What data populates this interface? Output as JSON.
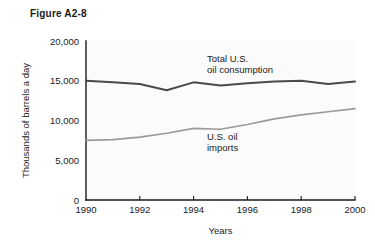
{
  "figure": {
    "title": "Figure A2-8"
  },
  "chart_data": {
    "type": "line",
    "title": "Figure A2-8",
    "xlabel": "Years",
    "ylabel": "Thousands of barrels a day",
    "x": [
      1990,
      1991,
      1992,
      1993,
      1994,
      1995,
      1996,
      1997,
      1998,
      1999,
      2000
    ],
    "xlim": [
      1990,
      2000
    ],
    "ylim": [
      0,
      20000
    ],
    "xticks": [
      1990,
      1992,
      1994,
      1996,
      1998,
      2000
    ],
    "xtick_labels": [
      "1990",
      "1992",
      "1994",
      "1996",
      "1998",
      "2000"
    ],
    "yticks": [
      0,
      5000,
      10000,
      15000,
      20000
    ],
    "ytick_labels": [
      "0",
      "5,000",
      "10,000",
      "15,000",
      "20,000"
    ],
    "grid": false,
    "legend_position": "inline-annotation",
    "series": [
      {
        "name": "Total U.S. oil consumption",
        "label_lines": [
          "Total U.S.",
          "oil consumption"
        ],
        "color": "#4a4a4a",
        "values": [
          15000,
          14800,
          14600,
          13800,
          14800,
          14400,
          14700,
          14900,
          15000,
          14600,
          14900
        ]
      },
      {
        "name": "U.S. oil imports",
        "label_lines": [
          "U.S. oil",
          "imports"
        ],
        "color": "#9a9a9a",
        "values": [
          7500,
          7600,
          7900,
          8400,
          9000,
          8900,
          9500,
          10200,
          10700,
          11100,
          11500
        ]
      }
    ]
  },
  "colors": {
    "axis": "#1a1a1a",
    "plot_background": "#fbfbfb",
    "page_background": "#ffffff",
    "consumption_line": "#4a4a4a",
    "imports_line": "#9a9a9a"
  }
}
